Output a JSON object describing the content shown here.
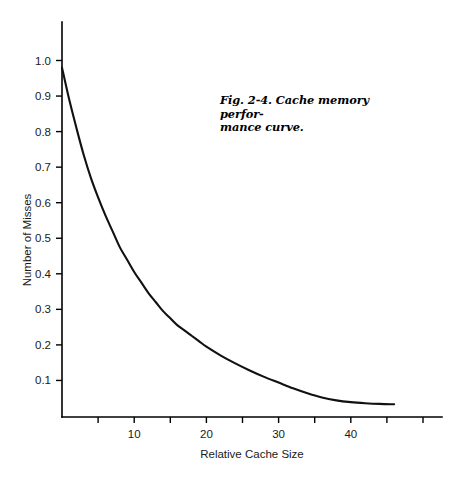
{
  "figure": {
    "caption_line1": "Fig. 2-4. Cache memory perfor-",
    "caption_line2": "mance curve.",
    "caption_full": "Fig. 2-4. Cache memory performance curve."
  },
  "chart_data": {
    "type": "line",
    "title": "",
    "xlabel": "Relative Cache Size",
    "ylabel": "Number of Misses",
    "xlim": [
      0,
      51
    ],
    "ylim": [
      0,
      1.08
    ],
    "grid": false,
    "legend": false,
    "legend_position": "none",
    "x_ticks_major": [
      10,
      20,
      30,
      40
    ],
    "x_tick_labels": [
      "10",
      "20",
      "30",
      "40"
    ],
    "x_ticks_all": [
      5,
      10,
      15,
      20,
      25,
      30,
      35,
      40,
      45,
      50
    ],
    "y_ticks": [
      0.1,
      0.2,
      0.3,
      0.4,
      0.5,
      0.6,
      0.7,
      0.8,
      0.9,
      1.0
    ],
    "y_tick_labels": [
      "0.1",
      "0.2",
      "0.3",
      "0.4",
      "0.5",
      "0.6",
      "0.7",
      "0.8",
      "0.9",
      "1.0"
    ],
    "series": [
      {
        "name": "Number of Misses",
        "color": "#111111",
        "x": [
          0,
          1,
          2,
          3,
          4,
          5,
          6,
          7,
          8,
          9,
          10,
          11,
          12,
          13,
          14,
          15,
          16,
          17,
          18,
          19,
          20,
          22,
          24,
          26,
          28,
          30,
          32,
          34,
          36,
          38,
          40,
          42,
          44,
          46
        ],
        "values": [
          0.98,
          0.89,
          0.81,
          0.735,
          0.67,
          0.615,
          0.565,
          0.52,
          0.475,
          0.44,
          0.405,
          0.375,
          0.345,
          0.32,
          0.295,
          0.275,
          0.255,
          0.24,
          0.225,
          0.21,
          0.195,
          0.17,
          0.148,
          0.128,
          0.11,
          0.094,
          0.078,
          0.064,
          0.052,
          0.044,
          0.039,
          0.036,
          0.034,
          0.033
        ]
      }
    ]
  },
  "colors": {
    "curve": "#111111",
    "axis": "#000000",
    "text": "#1a1a1a",
    "background": "#ffffff"
  }
}
